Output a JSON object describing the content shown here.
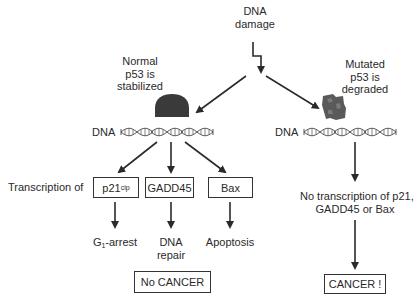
{
  "trigger": {
    "line1": "DNA",
    "line2": "damage"
  },
  "left_branch": {
    "status_lines": [
      "Normal",
      "p53 is",
      "stabilized"
    ],
    "dna_label": "DNA",
    "transcription_label": "Transcription of",
    "genes": [
      {
        "name": "p21",
        "superscript": "cip",
        "outcome_lines": [
          "G",
          "-arrest"
        ],
        "outcome_subscript": "1"
      },
      {
        "name": "GADD45",
        "superscript": "",
        "outcome_lines": [
          "DNA",
          "repair"
        ]
      },
      {
        "name": "Bax",
        "superscript": "",
        "outcome_lines": [
          "Apoptosis"
        ]
      }
    ],
    "result": "No CANCER"
  },
  "right_branch": {
    "status_lines": [
      "Mutated",
      "p53 is",
      "degraded"
    ],
    "dna_label": "DNA",
    "consequence_lines": [
      "No transcription of p21,",
      "GADD45 or Bax"
    ],
    "result": "CANCER !"
  },
  "colors": {
    "ink": "#2a2a2a",
    "p53_normal": "#3a3a3a",
    "p53_mutated": "#5a5a5a",
    "helix": "#555555"
  }
}
